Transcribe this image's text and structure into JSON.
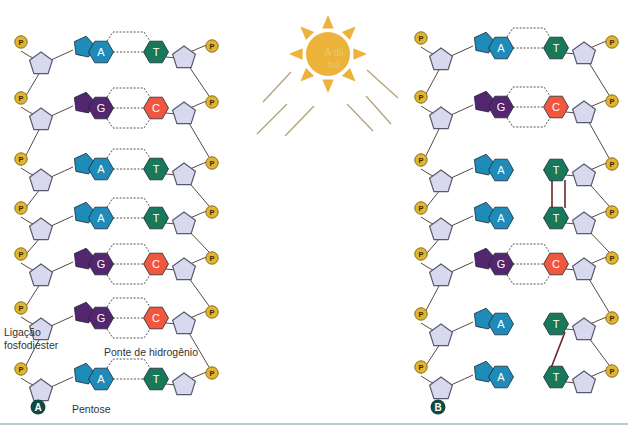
{
  "colors": {
    "adenine": "#1f8bb8",
    "thymine": "#17785a",
    "guanine": "#54266f",
    "cytosine": "#f0573e",
    "pentose": "#d8d9ee",
    "pentose_stroke": "#555a6e",
    "phosphate": "#e0b531",
    "phosphate_stroke": "#8a6b10",
    "backbone": "#5a4a44",
    "sun": "#edb23a",
    "rays": "#b5a27a",
    "dimer_bond": "#6b2727",
    "panel_badge": "#0f4a40"
  },
  "phosphate_label": "P",
  "sun": {
    "watermark_line1": "A dii",
    "watermark_line2": "bsi"
  },
  "panels": [
    {
      "id": "A",
      "badge": "A",
      "rows": [
        {
          "left": "A",
          "right": "T",
          "bonds": 2,
          "y": 52
        },
        {
          "left": "G",
          "right": "C",
          "bonds": 3,
          "y": 108
        },
        {
          "left": "A",
          "right": "T",
          "bonds": 2,
          "y": 169
        },
        {
          "left": "A",
          "right": "T",
          "bonds": 2,
          "y": 218
        },
        {
          "left": "G",
          "right": "C",
          "bonds": 3,
          "y": 264
        },
        {
          "left": "G",
          "right": "C",
          "bonds": 3,
          "y": 318
        },
        {
          "left": "A",
          "right": "T",
          "bonds": 2,
          "y": 379
        }
      ]
    },
    {
      "id": "B",
      "badge": "B",
      "rows": [
        {
          "left": "A",
          "right": "T",
          "bonds": 2,
          "y": 48
        },
        {
          "left": "G",
          "right": "C",
          "bonds": 3,
          "y": 107
        },
        {
          "left": "A",
          "right": "T",
          "bonds": 0,
          "y": 170,
          "dimer": "start-straight"
        },
        {
          "left": "A",
          "right": "T",
          "bonds": 0,
          "y": 218,
          "dimer": "end"
        },
        {
          "left": "G",
          "right": "C",
          "bonds": 3,
          "y": 264
        },
        {
          "left": "A",
          "right": "T",
          "bonds": 0,
          "y": 324,
          "dimer": "start-diag"
        },
        {
          "left": "A",
          "right": "T",
          "bonds": 0,
          "y": 377,
          "dimer": "end"
        }
      ]
    }
  ],
  "labels": {
    "ligacao_line1": "Ligação",
    "ligacao_line2": "fosfodiester",
    "ponte": "Ponte de hidrogênio",
    "pentose": "Pentose"
  }
}
